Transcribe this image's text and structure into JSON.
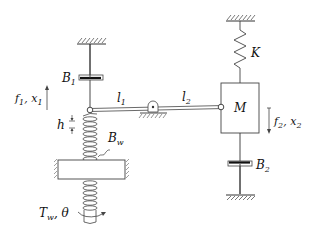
{
  "diagram": {
    "labels": {
      "B1": {
        "base": "B",
        "sub": "1"
      },
      "B2": {
        "base": "B",
        "sub": "2"
      },
      "Bw": {
        "base": "B",
        "sub": "w"
      },
      "K": "K",
      "M": "M",
      "l1": {
        "base": "l",
        "sub": "1"
      },
      "l2": {
        "base": "l",
        "sub": "2"
      },
      "h": "h",
      "f1x1": {
        "f": "f",
        "fsub": "1",
        "sep": ", ",
        "x": "x",
        "xsub": "1"
      },
      "f2x2": {
        "f": "f",
        "fsub": "2",
        "sep": ", ",
        "x": "x",
        "xsub": "2"
      },
      "Tw_theta": {
        "T": "T",
        "Tsub": "w",
        "sep": ", ",
        "theta": "θ"
      }
    },
    "components": [
      {
        "id": "ground-top-left",
        "type": "ground"
      },
      {
        "id": "damper-B1",
        "type": "damper"
      },
      {
        "id": "lever-pivot-joint",
        "type": "joint"
      },
      {
        "id": "lever",
        "type": "rigid-bar",
        "segments": [
          "l1",
          "l2"
        ]
      },
      {
        "id": "fulcrum",
        "type": "pivot"
      },
      {
        "id": "ground-top-right",
        "type": "ground"
      },
      {
        "id": "spring-K",
        "type": "spring"
      },
      {
        "id": "mass-M",
        "type": "mass"
      },
      {
        "id": "damper-B2",
        "type": "damper"
      },
      {
        "id": "ground-bottom-right",
        "type": "ground"
      },
      {
        "id": "worm-screw",
        "type": "screw"
      },
      {
        "id": "worm-nut-plate",
        "type": "fixed-plate"
      }
    ]
  }
}
